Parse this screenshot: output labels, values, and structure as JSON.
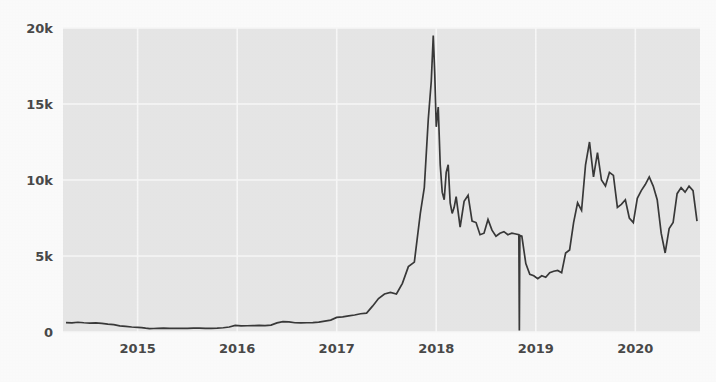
{
  "chart_data": {
    "type": "line",
    "title": "",
    "subtitle": "",
    "xlabel": "",
    "ylabel": "",
    "xlim": [
      2014.25,
      2020.65
    ],
    "ylim": [
      0,
      20000
    ],
    "grid": true,
    "legend": null,
    "legend_position": "none",
    "x_tick_labels": [
      "2015",
      "2016",
      "2017",
      "2018",
      "2019",
      "2020"
    ],
    "x_tick_values": [
      2015,
      2016,
      2017,
      2018,
      2019,
      2020
    ],
    "y_tick_labels": [
      "0",
      "5k",
      "10k",
      "15k",
      "20k"
    ],
    "y_tick_values": [
      0,
      5000,
      10000,
      15000,
      20000
    ],
    "line_color": "#3a3a3a",
    "plot_background": "#eaeaea",
    "gridline_color": "#fbfbfb",
    "annotations": [
      "sharp single-point drop to 0 near late 2018 (data glitch)",
      "all-time peak about 19.5k near the start of 2018"
    ],
    "series": [
      {
        "name": "price",
        "x": [
          2014.28,
          2014.34,
          2014.4,
          2014.46,
          2014.52,
          2014.58,
          2014.64,
          2014.7,
          2014.76,
          2014.82,
          2014.88,
          2014.94,
          2015.0,
          2015.04,
          2015.08,
          2015.12,
          2015.16,
          2015.2,
          2015.26,
          2015.32,
          2015.38,
          2015.44,
          2015.5,
          2015.56,
          2015.62,
          2015.68,
          2015.74,
          2015.8,
          2015.86,
          2015.92,
          2015.98,
          2016.04,
          2016.1,
          2016.16,
          2016.22,
          2016.28,
          2016.34,
          2016.4,
          2016.46,
          2016.52,
          2016.58,
          2016.64,
          2016.7,
          2016.76,
          2016.82,
          2016.88,
          2016.94,
          2017.0,
          2017.06,
          2017.12,
          2017.18,
          2017.24,
          2017.3,
          2017.36,
          2017.42,
          2017.48,
          2017.54,
          2017.6,
          2017.66,
          2017.72,
          2017.78,
          2017.84,
          2017.88,
          2017.92,
          2017.95,
          2017.97,
          2017.985,
          2018.0,
          2018.02,
          2018.04,
          2018.06,
          2018.08,
          2018.1,
          2018.12,
          2018.14,
          2018.16,
          2018.18,
          2018.2,
          2018.24,
          2018.28,
          2018.32,
          2018.36,
          2018.4,
          2018.44,
          2018.48,
          2018.52,
          2018.56,
          2018.6,
          2018.64,
          2018.68,
          2018.72,
          2018.76,
          2018.8,
          2018.83,
          2018.835,
          2018.84,
          2018.86,
          2018.9,
          2018.94,
          2018.98,
          2019.02,
          2019.06,
          2019.1,
          2019.14,
          2019.18,
          2019.22,
          2019.26,
          2019.3,
          2019.34,
          2019.38,
          2019.42,
          2019.46,
          2019.5,
          2019.54,
          2019.58,
          2019.62,
          2019.66,
          2019.7,
          2019.74,
          2019.78,
          2019.82,
          2019.86,
          2019.9,
          2019.94,
          2019.98,
          2020.02,
          2020.06,
          2020.1,
          2020.14,
          2020.18,
          2020.22,
          2020.26,
          2020.3,
          2020.34,
          2020.38,
          2020.42,
          2020.46,
          2020.5,
          2020.54,
          2020.58,
          2020.62
        ],
        "y": [
          620,
          600,
          640,
          610,
          590,
          600,
          570,
          520,
          480,
          400,
          370,
          330,
          310,
          290,
          250,
          220,
          230,
          240,
          250,
          235,
          240,
          245,
          240,
          250,
          260,
          235,
          240,
          250,
          280,
          330,
          430,
          400,
          410,
          420,
          430,
          425,
          450,
          600,
          680,
          660,
          610,
          600,
          610,
          620,
          650,
          720,
          780,
          960,
          1000,
          1060,
          1120,
          1200,
          1240,
          1700,
          2200,
          2500,
          2600,
          2500,
          3200,
          4300,
          4600,
          7800,
          9500,
          14000,
          16500,
          19500,
          17000,
          13500,
          14800,
          11000,
          9200,
          8700,
          10500,
          11000,
          8500,
          7800,
          8200,
          8900,
          6900,
          8600,
          9000,
          7300,
          7200,
          6400,
          6500,
          7400,
          6700,
          6300,
          6500,
          6600,
          6400,
          6500,
          6450,
          6400,
          100,
          6350,
          6300,
          4500,
          3800,
          3700,
          3500,
          3700,
          3600,
          3900,
          4000,
          4050,
          3900,
          5200,
          5400,
          7200,
          8500,
          8000,
          11000,
          12500,
          10200,
          11800,
          10000,
          9600,
          10500,
          10300,
          8200,
          8400,
          8700,
          7500,
          7200,
          8800,
          9300,
          9700,
          10200,
          9600,
          8700,
          6500,
          5200,
          6800,
          7200,
          9100,
          9500,
          9200,
          9600,
          9300,
          7300
        ]
      }
    ]
  },
  "axes": {
    "plot_left_px": 63,
    "plot_right_px": 700,
    "plot_top_px": 28,
    "plot_bottom_px": 332
  }
}
